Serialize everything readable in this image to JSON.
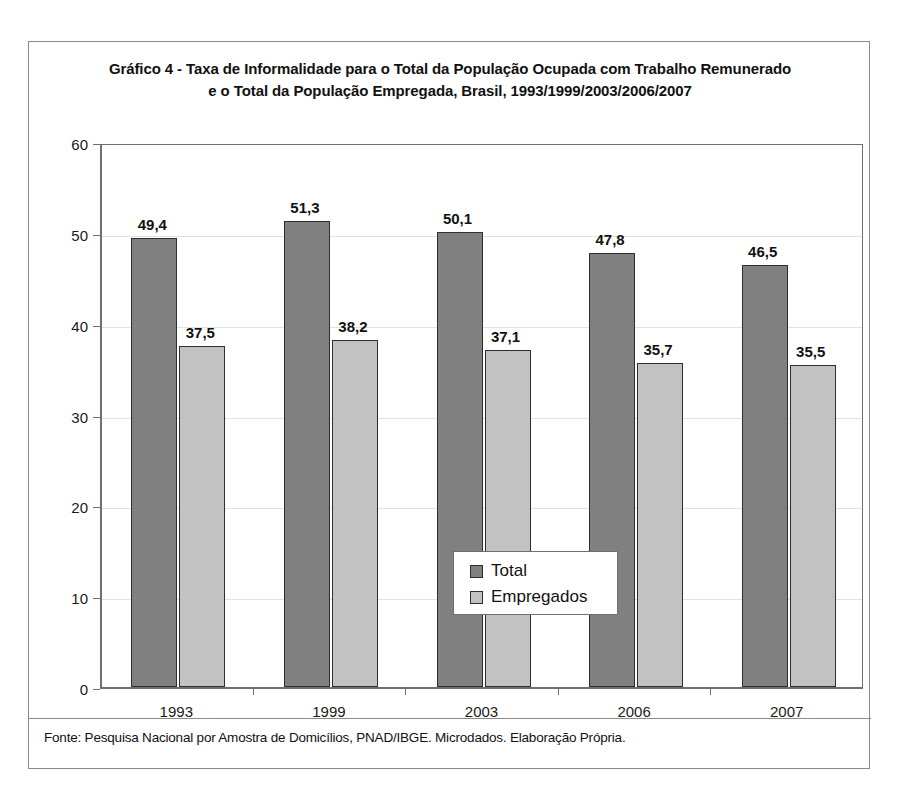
{
  "figure": {
    "title_line1": "Gráfico 4 - Taxa de Informalidade para o Total da População Ocupada com Trabalho Remunerado",
    "title_line2": "e o Total da População Empregada,  Brasil, 1993/1999/2003/2006/2007",
    "source_note": "Fonte: Pesquisa Nacional por Amostra de Domicílios, PNAD/IBGE. Microdados. Elaboração Própria."
  },
  "colors": {
    "total": "#808080",
    "empregados": "#c2c2c2",
    "bar_outline": "#2e2e2e",
    "axis": "#6f6f6f",
    "gridline": "#e2e2e2",
    "frame": "#8a8a8a"
  },
  "chart_data": {
    "type": "bar",
    "title": "Gráfico 4 - Taxa de Informalidade para o Total da População Ocupada com Trabalho Remunerado e o Total da População Empregada,  Brasil, 1993/1999/2003/2006/2007",
    "xlabel": "",
    "ylabel": "",
    "categories": [
      "1993",
      "1999",
      "2003",
      "2006",
      "2007"
    ],
    "series": [
      {
        "name": "Total",
        "color": "#808080",
        "values": [
          49.4,
          51.3,
          50.1,
          47.8,
          46.5
        ],
        "labels": [
          "49,4",
          "51,3",
          "50,1",
          "47,8",
          "46,5"
        ]
      },
      {
        "name": "Empregados",
        "color": "#c2c2c2",
        "values": [
          37.5,
          38.2,
          37.1,
          35.7,
          35.5
        ],
        "labels": [
          "37,5",
          "38,2",
          "37,1",
          "35,7",
          "35,5"
        ]
      }
    ],
    "ylim": [
      0,
      60
    ],
    "yticks": [
      0,
      10,
      20,
      30,
      40,
      50,
      60
    ],
    "ytick_labels": [
      "0",
      "10",
      "20",
      "30",
      "40",
      "50",
      "60"
    ],
    "grid": true,
    "legend_position": "center"
  }
}
